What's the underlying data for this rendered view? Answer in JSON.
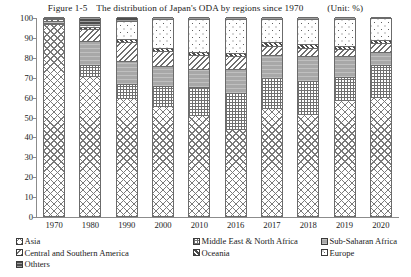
{
  "title": {
    "figure_label": "Figure 1-5",
    "text": "The distribution of Japan's ODA by regions since 1970",
    "unit": "(Unit: %)"
  },
  "axes": {
    "y_ticks": [
      "0",
      "10",
      "20",
      "30",
      "40",
      "50",
      "60",
      "70",
      "80",
      "90",
      "100"
    ],
    "x_ticks": [
      "1970",
      "1980",
      "1990",
      "2000",
      "2010",
      "2016",
      "2017",
      "2018",
      "2019",
      "2020"
    ]
  },
  "legend": {
    "items": [
      {
        "label": "Asia",
        "key": "asia",
        "pattern": "crosshatch-diagonal"
      },
      {
        "label": "Middle East & North Africa",
        "key": "mena",
        "pattern": "fine-checker"
      },
      {
        "label": "Sub-Saharan Africa",
        "key": "ssa",
        "pattern": "solid-gray"
      },
      {
        "label": "Central and Southern America",
        "key": "csa",
        "pattern": "diagonal-stripe"
      },
      {
        "label": "Oceania",
        "key": "oceania",
        "pattern": "dense-diagonal"
      },
      {
        "label": "Europe",
        "key": "europe",
        "pattern": "dotted"
      },
      {
        "label": "Othters",
        "key": "others",
        "pattern": "dark-horizontal"
      }
    ]
  },
  "chart_data": {
    "type": "bar",
    "stacked": true,
    "xlabel": "",
    "ylabel": "",
    "ylim": [
      0,
      100
    ],
    "unit": "%",
    "grid": false,
    "legend_position": "bottom",
    "categories": [
      "1970",
      "1980",
      "1990",
      "2000",
      "2010",
      "2016",
      "2017",
      "2018",
      "2019",
      "2020"
    ],
    "series": [
      {
        "name": "Asia",
        "key": "asia",
        "values": [
          96.0,
          70.0,
          59.0,
          55.0,
          50.5,
          43.0,
          54.0,
          51.0,
          58.0,
          59.5
        ]
      },
      {
        "name": "Middle East & North Africa",
        "key": "mena",
        "values": [
          0.8,
          6.0,
          7.5,
          10.5,
          14.5,
          19.0,
          15.5,
          17.0,
          12.0,
          16.5
        ]
      },
      {
        "name": "Sub-Saharan Africa",
        "key": "ssa",
        "values": [
          1.0,
          12.0,
          11.5,
          10.0,
          9.0,
          12.0,
          11.5,
          12.5,
          10.5,
          6.5
        ]
      },
      {
        "name": "Central and Southern America",
        "key": "csa",
        "values": [
          1.0,
          6.0,
          9.5,
          7.5,
          7.0,
          6.5,
          4.5,
          4.0,
          3.5,
          4.5
        ]
      },
      {
        "name": "Oceania",
        "key": "oceania",
        "values": [
          0.4,
          1.0,
          1.5,
          1.5,
          1.5,
          1.5,
          2.0,
          2.0,
          1.5,
          1.5
        ]
      },
      {
        "name": "Europe",
        "key": "europe",
        "values": [
          0.3,
          1.0,
          9.0,
          14.5,
          16.5,
          17.0,
          11.5,
          12.5,
          13.5,
          11.0
        ]
      },
      {
        "name": "Othters",
        "key": "others",
        "values": [
          0.5,
          4.0,
          2.0,
          1.0,
          1.0,
          1.0,
          1.0,
          1.0,
          1.0,
          0.5
        ]
      }
    ]
  }
}
